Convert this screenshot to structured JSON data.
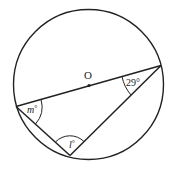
{
  "diagram": {
    "center_label": "O",
    "angles": {
      "right_angle": "29°",
      "left_angle_var": "m",
      "left_angle_unit": "°",
      "bottom_angle_var": "l",
      "bottom_angle_unit": "°"
    }
  }
}
